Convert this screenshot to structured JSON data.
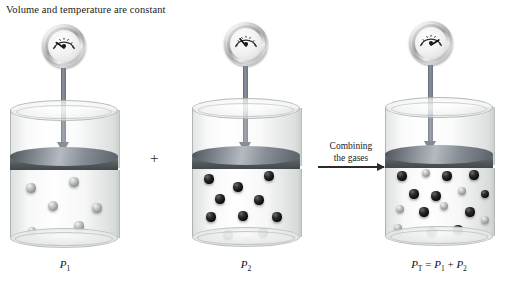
{
  "caption": "Volume and temperature are constant",
  "operators": {
    "plus": "+"
  },
  "process_arrow": {
    "line1": "Combining",
    "line2": "the gases",
    "icon": "right-arrow-icon"
  },
  "containers": [
    {
      "id": "container-1",
      "label_base": "P",
      "label_sub": "1",
      "gauge": {
        "icon": "pressure-gauge-icon",
        "needle_deg": -42
      },
      "particle_counts": {
        "gray": 6,
        "black": 0
      }
    },
    {
      "id": "container-2",
      "label_base": "P",
      "label_sub": "2",
      "gauge": {
        "icon": "pressure-gauge-icon",
        "needle_deg": -20
      },
      "particle_counts": {
        "gray": 0,
        "black": 10
      }
    },
    {
      "id": "container-3",
      "label_formula": "P",
      "label_sub_t": "T",
      "label_eq": " = ",
      "label_p1": "P",
      "label_sub_1": "1",
      "label_plus": " + ",
      "label_p2": "P",
      "label_sub_2": "2",
      "gauge": {
        "icon": "pressure-gauge-icon",
        "needle_deg": 10
      },
      "particle_counts": {
        "gray": 6,
        "black": 10
      }
    }
  ],
  "chart_data": {
    "type": "diagram",
    "title": "Volume and temperature are constant",
    "panels": [
      {
        "name": "P1",
        "gas": "gray particles",
        "count": 6,
        "pressure_label": "P1"
      },
      {
        "name": "P2",
        "gas": "black particles",
        "count": 10,
        "pressure_label": "P2"
      },
      {
        "name": "PT",
        "gas": "mixed gray and black particles",
        "count": 16,
        "pressure_label": "PT = P1 + P2"
      }
    ],
    "relation": "PT = P1 + P2",
    "transition_label": "Combining the gases"
  },
  "particles": {
    "c1": [
      {
        "x": 20,
        "y": 58,
        "r": 4.6,
        "c": "gray"
      },
      {
        "x": 63,
        "y": 52,
        "r": 4.6,
        "c": "gray"
      },
      {
        "x": 42,
        "y": 76,
        "r": 4.8,
        "c": "gray"
      },
      {
        "x": 86,
        "y": 78,
        "r": 4.6,
        "c": "gray"
      },
      {
        "x": 21,
        "y": 101,
        "r": 4.4,
        "c": "gray"
      },
      {
        "x": 68,
        "y": 96,
        "r": 4.6,
        "c": "gray"
      }
    ],
    "c2": [
      {
        "x": 16,
        "y": 50,
        "r": 4.6,
        "c": "black"
      },
      {
        "x": 76,
        "y": 47,
        "r": 4.6,
        "c": "black"
      },
      {
        "x": 45,
        "y": 58,
        "r": 4.6,
        "c": "black"
      },
      {
        "x": 27,
        "y": 70,
        "r": 4.6,
        "c": "black"
      },
      {
        "x": 66,
        "y": 71,
        "r": 4.6,
        "c": "black"
      },
      {
        "x": 18,
        "y": 88,
        "r": 4.6,
        "c": "black"
      },
      {
        "x": 50,
        "y": 87,
        "r": 4.6,
        "c": "black"
      },
      {
        "x": 84,
        "y": 88,
        "r": 4.6,
        "c": "black"
      },
      {
        "x": 35,
        "y": 106,
        "r": 4.6,
        "c": "black"
      },
      {
        "x": 70,
        "y": 104,
        "r": 4.6,
        "c": "black"
      }
    ],
    "c3": [
      {
        "x": 16,
        "y": 48,
        "r": 4.6,
        "c": "black"
      },
      {
        "x": 40,
        "y": 45,
        "r": 4.4,
        "c": "gray"
      },
      {
        "x": 61,
        "y": 48,
        "r": 4.6,
        "c": "black"
      },
      {
        "x": 88,
        "y": 47,
        "r": 4.6,
        "c": "black"
      },
      {
        "x": 28,
        "y": 66,
        "r": 4.6,
        "c": "black"
      },
      {
        "x": 50,
        "y": 68,
        "r": 4.6,
        "c": "black"
      },
      {
        "x": 76,
        "y": 63,
        "r": 4.4,
        "c": "gray"
      },
      {
        "x": 99,
        "y": 66,
        "r": 4.4,
        "c": "black"
      },
      {
        "x": 14,
        "y": 81,
        "r": 4.4,
        "c": "gray"
      },
      {
        "x": 38,
        "y": 84,
        "r": 4.6,
        "c": "black"
      },
      {
        "x": 58,
        "y": 78,
        "r": 4.4,
        "c": "gray"
      },
      {
        "x": 84,
        "y": 84,
        "r": 4.6,
        "c": "black"
      },
      {
        "x": 99,
        "y": 92,
        "r": 4.4,
        "c": "gray"
      },
      {
        "x": 12,
        "y": 100,
        "r": 4.4,
        "c": "gray"
      },
      {
        "x": 46,
        "y": 104,
        "r": 4.6,
        "c": "black"
      },
      {
        "x": 72,
        "y": 102,
        "r": 4.6,
        "c": "black"
      }
    ]
  }
}
